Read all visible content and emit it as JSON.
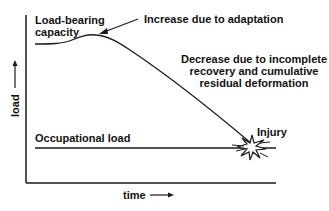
{
  "diagram": {
    "y_axis_label": "load",
    "x_axis_label": "time",
    "labels": {
      "capacity_line1": "Load-bearing",
      "capacity_line2": "capacity",
      "increase": "Increase due to adaptation",
      "decrease_line1": "Decrease due to incomplete",
      "decrease_line2": "recovery and cumulative",
      "decrease_line3": "residual deformation",
      "occupational": "Occupational load",
      "injury": "Injury"
    },
    "colors": {
      "line": "#1a1a1a",
      "background": "#ffffff"
    }
  }
}
